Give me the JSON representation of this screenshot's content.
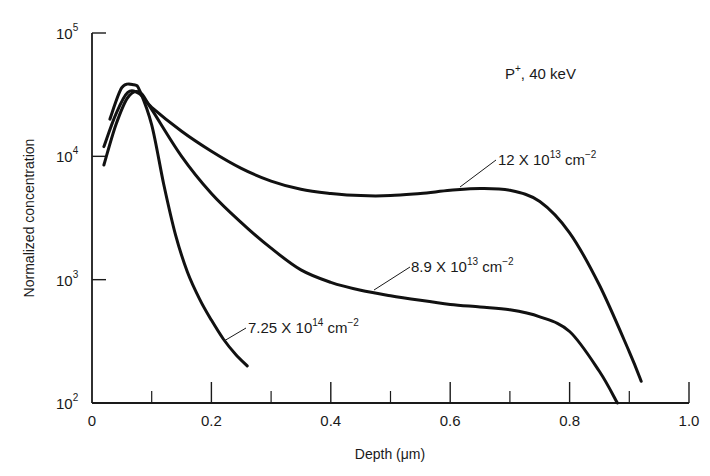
{
  "chart_data": {
    "type": "line",
    "title": "P+, 40 keV",
    "xlabel": "Depth (μm)",
    "ylabel": "Normalized concentration",
    "xlim": [
      0,
      1.0
    ],
    "ylim": [
      100,
      100000
    ],
    "yscale": "log",
    "grid": false,
    "x_ticks": [
      "0",
      "0.2",
      "0.4",
      "0.6",
      "0.8",
      "1.0"
    ],
    "x_minor_ticks": [
      0.1,
      0.3,
      0.5,
      0.7,
      0.9
    ],
    "y_ticks": [
      {
        "base": "10",
        "exp": "2",
        "value": 100
      },
      {
        "base": "10",
        "exp": "3",
        "value": 1000
      },
      {
        "base": "10",
        "exp": "4",
        "value": 10000
      },
      {
        "base": "10",
        "exp": "5",
        "value": 100000
      }
    ],
    "series": [
      {
        "name": "12 X 10^13 cm^-2",
        "label_main": "12 X 10",
        "label_exp": "13",
        "label_unit": " cm",
        "label_unit_exp": "−2",
        "x": [
          0.02,
          0.04,
          0.06,
          0.08,
          0.1,
          0.15,
          0.2,
          0.25,
          0.3,
          0.35,
          0.4,
          0.45,
          0.5,
          0.55,
          0.6,
          0.65,
          0.7,
          0.75,
          0.8,
          0.85,
          0.9,
          0.92
        ],
        "y": [
          12000,
          22000,
          33000,
          32000,
          25000,
          16000,
          11000,
          8000,
          6300,
          5400,
          5000,
          4800,
          4800,
          5000,
          5300,
          5500,
          5300,
          4300,
          2400,
          900,
          260,
          150
        ]
      },
      {
        "name": "8.9 X 10^13 cm^-2",
        "label_main": "8.9 X 10",
        "label_exp": "13",
        "label_unit": " cm",
        "label_unit_exp": "−2",
        "x": [
          0.02,
          0.04,
          0.06,
          0.08,
          0.1,
          0.15,
          0.2,
          0.25,
          0.3,
          0.35,
          0.4,
          0.45,
          0.5,
          0.55,
          0.6,
          0.65,
          0.7,
          0.75,
          0.8,
          0.85,
          0.88
        ],
        "y": [
          8500,
          18000,
          30000,
          33000,
          24000,
          10000,
          5000,
          2900,
          1800,
          1200,
          950,
          820,
          740,
          680,
          630,
          600,
          570,
          500,
          380,
          180,
          100
        ]
      },
      {
        "name": "7.25 X 10^14 cm^-2",
        "label_main": "7.25 X 10",
        "label_exp": "14",
        "label_unit": " cm",
        "label_unit_exp": "−2",
        "x": [
          0.03,
          0.05,
          0.07,
          0.08,
          0.1,
          0.12,
          0.14,
          0.16,
          0.18,
          0.2,
          0.22,
          0.24,
          0.26
        ],
        "y": [
          20000,
          36000,
          38000,
          34000,
          18000,
          6000,
          2300,
          1150,
          700,
          470,
          330,
          250,
          200
        ]
      }
    ],
    "annotations": [
      {
        "text": "P",
        "sup": "+",
        "rest": ", 40 keV"
      }
    ]
  }
}
